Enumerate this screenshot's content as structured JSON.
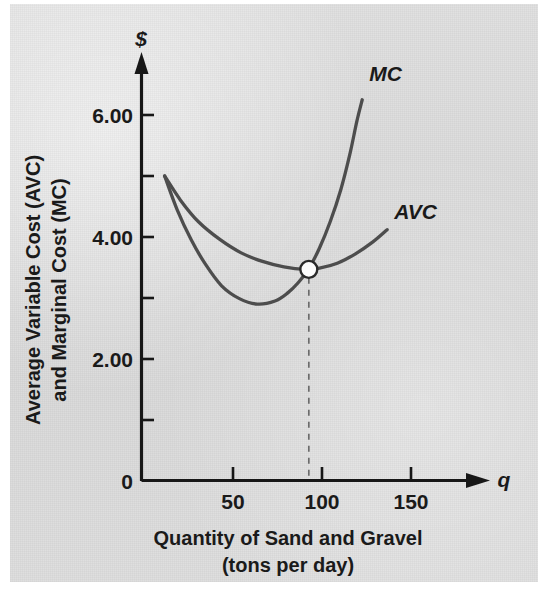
{
  "figure": {
    "background_color": "#dcdcdc",
    "curve_color": "#4d4d4d",
    "axis_color": "#171717",
    "marker_fill": "#fdfdfd"
  },
  "chart_data": {
    "type": "line",
    "title": "",
    "subtitle": "",
    "xlabel_line1": "Quantity of Sand and Gravel",
    "xlabel_line2": "(tons per day)",
    "ylabel_line1": "Average Variable Cost (AVC)",
    "ylabel_line2": "and Marginal Cost (MC)",
    "x_axis_symbol": "q",
    "y_axis_symbol": "$",
    "origin_label": "0",
    "grid": false,
    "legend_position": "inline-curve-labels",
    "xlim": [
      0,
      170
    ],
    "ylim": [
      0,
      6.8
    ],
    "xticks": [
      50,
      100,
      150
    ],
    "xtick_labels": [
      "50",
      "100",
      "150"
    ],
    "yticks": [
      2.0,
      4.0,
      6.0
    ],
    "ytick_labels": [
      "2.00",
      "4.00",
      "6.00"
    ],
    "y_minor_ticks": [
      1.0,
      3.0,
      5.0
    ],
    "series": [
      {
        "name": "MC",
        "label": "MC",
        "label_x": 128,
        "label_y": 6.55,
        "points": [
          [
            13,
            5.0
          ],
          [
            20,
            4.45
          ],
          [
            28,
            3.95
          ],
          [
            36,
            3.55
          ],
          [
            45,
            3.2
          ],
          [
            55,
            2.99
          ],
          [
            65,
            2.9
          ],
          [
            75,
            2.95
          ],
          [
            82,
            3.08
          ],
          [
            88,
            3.25
          ],
          [
            94,
            3.48
          ],
          [
            100,
            3.82
          ],
          [
            106,
            4.25
          ],
          [
            112,
            4.78
          ],
          [
            117,
            5.35
          ],
          [
            121,
            5.9
          ],
          [
            124,
            6.25
          ]
        ]
      },
      {
        "name": "AVC",
        "label": "AVC",
        "label_x": 142,
        "label_y": 4.3,
        "points": [
          [
            13,
            5.0
          ],
          [
            22,
            4.6
          ],
          [
            32,
            4.25
          ],
          [
            44,
            3.96
          ],
          [
            56,
            3.74
          ],
          [
            68,
            3.6
          ],
          [
            80,
            3.51
          ],
          [
            92,
            3.47
          ],
          [
            100,
            3.49
          ],
          [
            110,
            3.57
          ],
          [
            120,
            3.72
          ],
          [
            130,
            3.92
          ],
          [
            138,
            4.12
          ]
        ]
      }
    ],
    "annotations": [
      {
        "name": "avc-minimum-intersection",
        "type": "point-marker",
        "x": 94,
        "y": 3.47,
        "drop_line": true,
        "drop_line_style": "dashed",
        "label": ""
      }
    ]
  }
}
